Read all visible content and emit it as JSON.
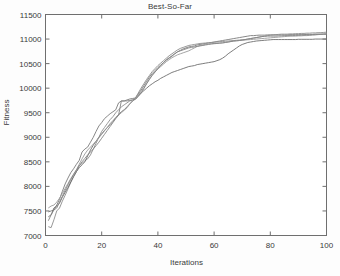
{
  "chart_data": {
    "type": "line",
    "title": "Best-So-Far",
    "xlabel": "Iterations",
    "ylabel": "Fitness",
    "xlim": [
      0,
      100
    ],
    "ylim": [
      7000,
      11500
    ],
    "xticks": [
      0,
      20,
      40,
      60,
      80,
      100
    ],
    "yticks": [
      7000,
      7500,
      8000,
      8500,
      9000,
      9500,
      10000,
      10500,
      11000,
      11500
    ],
    "grid": false,
    "legend": false,
    "legend_position": "none",
    "line_colors": [
      "#7a7a7a",
      "#8c8c8c",
      "#6e6e6e",
      "#9a9a9a",
      "#838383"
    ],
    "x": [
      1,
      2,
      3,
      4,
      5,
      6,
      7,
      8,
      9,
      10,
      11,
      12,
      13,
      14,
      15,
      16,
      17,
      18,
      19,
      20,
      21,
      22,
      23,
      24,
      25,
      26,
      27,
      28,
      29,
      30,
      31,
      32,
      33,
      34,
      35,
      36,
      37,
      38,
      39,
      40,
      41,
      42,
      43,
      44,
      45,
      46,
      47,
      48,
      49,
      50,
      51,
      52,
      53,
      54,
      55,
      56,
      57,
      58,
      59,
      60,
      61,
      62,
      63,
      64,
      65,
      66,
      67,
      68,
      69,
      70,
      71,
      72,
      73,
      74,
      75,
      76,
      77,
      78,
      79,
      80,
      81,
      82,
      83,
      84,
      85,
      86,
      87,
      88,
      89,
      90,
      91,
      92,
      93,
      94,
      95,
      96,
      97,
      98,
      99,
      100
    ],
    "series": [
      {
        "name": "run-1",
        "values": [
          7480,
          7500,
          7520,
          7620,
          7740,
          7900,
          8050,
          8170,
          8280,
          8360,
          8450,
          8530,
          8700,
          8760,
          8800,
          8900,
          9000,
          9120,
          9230,
          9300,
          9380,
          9430,
          9480,
          9520,
          9560,
          9700,
          9740,
          9740,
          9760,
          9780,
          9790,
          9800,
          9880,
          9960,
          10050,
          10140,
          10230,
          10300,
          10360,
          10420,
          10470,
          10520,
          10570,
          10610,
          10650,
          10700,
          10740,
          10770,
          10800,
          10820,
          10840,
          10850,
          10860,
          10880,
          10890,
          10900,
          10910,
          10920,
          10930,
          10940,
          10950,
          10960,
          10970,
          10980,
          10990,
          11000,
          11010,
          11020,
          11030,
          11040,
          11050,
          11060,
          11070,
          11070,
          11075,
          11080,
          11080,
          11080,
          11085,
          11085,
          11085,
          11085,
          11085,
          11085,
          11085,
          11085,
          11090,
          11090,
          11090,
          11090,
          11090,
          11090,
          11095,
          11095,
          11095,
          11100,
          11100,
          11100,
          11100,
          11100
        ]
      },
      {
        "name": "run-2",
        "values": [
          7180,
          7160,
          7320,
          7500,
          7560,
          7700,
          7820,
          7950,
          8080,
          8200,
          8300,
          8420,
          8470,
          8520,
          8560,
          8640,
          8760,
          8880,
          9000,
          9120,
          9200,
          9280,
          9360,
          9420,
          9500,
          9560,
          9620,
          9660,
          9700,
          9740,
          9760,
          9800,
          9900,
          10000,
          10090,
          10180,
          10260,
          10340,
          10400,
          10460,
          10510,
          10560,
          10610,
          10660,
          10700,
          10740,
          10780,
          10810,
          10830,
          10850,
          10870,
          10880,
          10890,
          10900,
          10910,
          10915,
          10920,
          10925,
          10930,
          10935,
          10940,
          10945,
          10950,
          10955,
          10960,
          10965,
          10970,
          10975,
          10980,
          10985,
          10990,
          11000,
          11010,
          11020,
          11030,
          11040,
          11050,
          11060,
          11070,
          11080,
          11085,
          11090,
          11095,
          11100,
          11100,
          11100,
          11105,
          11105,
          11110,
          11110,
          11115,
          11115,
          11120,
          11120,
          11125,
          11125,
          11130,
          11130,
          11135,
          11140
        ]
      },
      {
        "name": "run-3",
        "values": [
          7380,
          7420,
          7560,
          7600,
          7660,
          7780,
          7880,
          7980,
          8090,
          8200,
          8300,
          8380,
          8440,
          8500,
          8620,
          8740,
          8840,
          8920,
          9000,
          9070,
          9140,
          9200,
          9260,
          9320,
          9400,
          9460,
          9520,
          9560,
          9620,
          9680,
          9740,
          9780,
          9840,
          9900,
          9950,
          10000,
          10050,
          10090,
          10130,
          10160,
          10200,
          10230,
          10260,
          10290,
          10320,
          10340,
          10360,
          10380,
          10400,
          10420,
          10440,
          10450,
          10460,
          10480,
          10490,
          10500,
          10510,
          10520,
          10530,
          10540,
          10560,
          10580,
          10610,
          10650,
          10700,
          10740,
          10780,
          10820,
          10860,
          10890,
          10910,
          10930,
          10940,
          10950,
          10960,
          10965,
          10970,
          10975,
          10980,
          10985,
          10990,
          10990,
          10990,
          10990,
          10990,
          10990,
          10990,
          10990,
          10990,
          10995,
          10995,
          10995,
          10995,
          10995,
          10995,
          11000,
          11000,
          11000,
          11000,
          11000
        ]
      },
      {
        "name": "run-4",
        "values": [
          7560,
          7600,
          7620,
          7680,
          7760,
          7860,
          7960,
          8060,
          8160,
          8250,
          8340,
          8450,
          8560,
          8660,
          8740,
          8800,
          8860,
          8920,
          8990,
          9060,
          9130,
          9200,
          9280,
          9340,
          9400,
          9450,
          9500,
          9550,
          9600,
          9680,
          9740,
          9790,
          9860,
          9930,
          10010,
          10100,
          10190,
          10270,
          10330,
          10390,
          10440,
          10490,
          10540,
          10580,
          10620,
          10650,
          10680,
          10700,
          10720,
          10740,
          10760,
          10790,
          10820,
          10850,
          10870,
          10880,
          10890,
          10900,
          10905,
          10910,
          10915,
          10920,
          10925,
          10930,
          10940,
          10950,
          10960,
          10965,
          10970,
          10975,
          10980,
          10985,
          10990,
          10995,
          11000,
          11005,
          11010,
          11015,
          11020,
          11025,
          11030,
          11035,
          11040,
          11045,
          11050,
          11055,
          11060,
          11060,
          11060,
          11065,
          11065,
          11070,
          11070,
          11075,
          11080,
          11085,
          11090,
          11095,
          11100,
          11110
        ]
      },
      {
        "name": "run-5",
        "values": [
          7300,
          7420,
          7520,
          7560,
          7680,
          7800,
          7920,
          8030,
          8140,
          8240,
          8330,
          8420,
          8500,
          8570,
          8640,
          8700,
          8760,
          8830,
          8900,
          8980,
          9060,
          9140,
          9220,
          9300,
          9380,
          9450,
          9740,
          9740,
          9740,
          9750,
          9760,
          9770,
          9830,
          9900,
          9990,
          10090,
          10180,
          10260,
          10330,
          10400,
          10460,
          10520,
          10580,
          10620,
          10660,
          10700,
          10740,
          10760,
          10780,
          10800,
          10820,
          10830,
          10840,
          10850,
          10860,
          10870,
          10880,
          10890,
          10900,
          10905,
          10910,
          10915,
          10920,
          10930,
          10940,
          10950,
          10960,
          10965,
          10970,
          10980,
          10990,
          11000,
          11010,
          11020,
          11030,
          11040,
          11050,
          11055,
          11060,
          11060,
          11060,
          11060,
          11065,
          11065,
          11070,
          11070,
          11070,
          11070,
          11075,
          11075,
          11080,
          11080,
          11085,
          11085,
          11090,
          11090,
          11095,
          11095,
          11100,
          11100
        ]
      }
    ]
  },
  "figure": {
    "title": "Best-So-Far",
    "xlabel": "Iterations",
    "ylabel": "Fitness"
  }
}
